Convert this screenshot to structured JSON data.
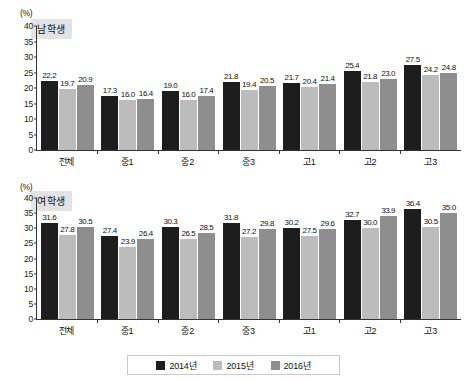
{
  "axis": {
    "unit": "(%)",
    "yticks": [
      0,
      5,
      10,
      15,
      20,
      25,
      30,
      35,
      40
    ],
    "ymin": 0,
    "ymax": 40
  },
  "panels": [
    {
      "id": "male",
      "title": "남학생"
    },
    {
      "id": "female",
      "title": "여학생"
    }
  ],
  "legend": {
    "items": [
      {
        "label": "2014년",
        "color": "#1d1d1d"
      },
      {
        "label": "2015년",
        "color": "#bcbcbc"
      },
      {
        "label": "2016년",
        "color": "#8e8e8e"
      }
    ]
  },
  "chart_data": [
    {
      "type": "bar",
      "title": "남학생",
      "xlabel": "",
      "ylabel": "(%)",
      "ylim": [
        0,
        40
      ],
      "grid": false,
      "legend_position": "bottom",
      "categories": [
        "전체",
        "중1",
        "중2",
        "중3",
        "고1",
        "고2",
        "고3"
      ],
      "series": [
        {
          "name": "2014년",
          "values": [
            22.2,
            17.3,
            19.0,
            21.8,
            21.7,
            25.4,
            27.5
          ]
        },
        {
          "name": "2015년",
          "values": [
            19.7,
            16.0,
            16.0,
            19.4,
            20.4,
            21.8,
            24.2
          ]
        },
        {
          "name": "2016년",
          "values": [
            20.9,
            16.4,
            17.4,
            20.5,
            21.4,
            23.0,
            24.8
          ]
        }
      ]
    },
    {
      "type": "bar",
      "title": "여학생",
      "xlabel": "",
      "ylabel": "(%)",
      "ylim": [
        0,
        40
      ],
      "grid": false,
      "legend_position": "bottom",
      "categories": [
        "전체",
        "중1",
        "중2",
        "중3",
        "고1",
        "고2",
        "고3"
      ],
      "series": [
        {
          "name": "2014년",
          "values": [
            31.6,
            27.4,
            30.3,
            31.8,
            30.2,
            32.7,
            36.4
          ]
        },
        {
          "name": "2015년",
          "values": [
            27.8,
            23.9,
            26.5,
            27.2,
            27.5,
            30.0,
            30.5
          ]
        },
        {
          "name": "2016년",
          "values": [
            30.5,
            26.4,
            28.5,
            29.8,
            29.6,
            33.9,
            35.0
          ]
        }
      ]
    }
  ]
}
